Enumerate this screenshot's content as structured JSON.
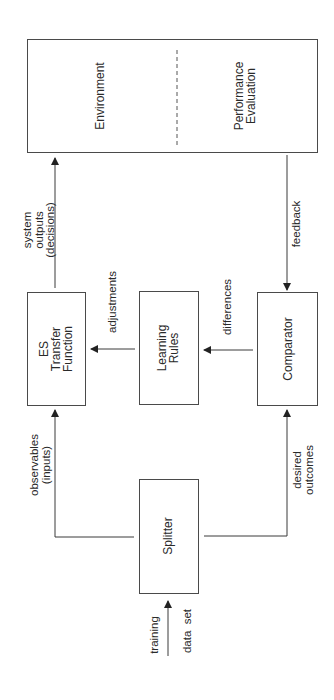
{
  "diagram": {
    "type": "block-flow",
    "orientation": "rotated-90-ccw",
    "nodes": {
      "environment": {
        "lines": [
          "Environment"
        ]
      },
      "performance_evaluation": {
        "lines": [
          "Performance",
          "Evaluation"
        ]
      },
      "es_transfer_function": {
        "lines": [
          "ES",
          "Transfer",
          "Function"
        ]
      },
      "learning_rules": {
        "lines": [
          "Learning",
          "Rules"
        ]
      },
      "comparator": {
        "lines": [
          "Comparator"
        ]
      },
      "splitter": {
        "lines": [
          "Splitter"
        ]
      }
    },
    "edges": {
      "system_outputs": {
        "lines": [
          "system",
          "outputs",
          "(decisions)"
        ],
        "from": "ES Transfer Function",
        "to": "Environment"
      },
      "feedback": {
        "lines": [
          "feedback"
        ],
        "from": "Performance Evaluation",
        "to": "Comparator"
      },
      "adjustments": {
        "lines": [
          "adjustments"
        ],
        "from": "Learning Rules",
        "to": "ES Transfer Function"
      },
      "differences": {
        "lines": [
          "differences"
        ],
        "from": "Comparator",
        "to": "Learning Rules"
      },
      "observables": {
        "lines": [
          "observables",
          "(inputs)"
        ],
        "from": "Splitter",
        "to": "ES Transfer Function"
      },
      "desired_outcomes": {
        "lines": [
          "desired",
          "outcomes"
        ],
        "from": "Splitter",
        "to": "Comparator"
      },
      "training_data_set": {
        "lines": [
          "training",
          "data  set"
        ],
        "from": "input",
        "to": "Splitter"
      }
    },
    "colors": {
      "line": "#3a3a3a",
      "text": "#2a2a2a",
      "background": "#ffffff"
    }
  }
}
